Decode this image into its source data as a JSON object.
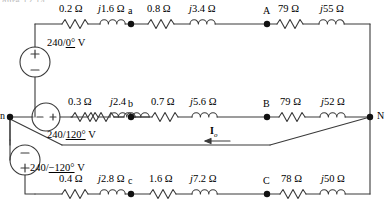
{
  "figure": {
    "cut_off_caption": "gure 12.14",
    "type": "three-phase-circuit-diagram"
  },
  "sources": [
    {
      "id": "phase-a",
      "label_value": "240",
      "label_angle": "0°",
      "label_unit": "V",
      "orientation": "vertical",
      "top_sign": "+",
      "bottom_sign": "−"
    },
    {
      "id": "phase-b",
      "label_value": "240",
      "label_angle": "120°",
      "label_unit": "V",
      "orientation": "horizontal",
      "left_sign": "−",
      "right_sign": "+"
    },
    {
      "id": "phase-c",
      "label_value": "240",
      "label_angle": "−120°",
      "label_unit": "V",
      "orientation": "vertical",
      "top_sign": "−",
      "bottom_sign": "+"
    }
  ],
  "nodes": [
    {
      "name": "n",
      "x": 10,
      "y": 117
    },
    {
      "name": "a",
      "x": 131,
      "y": 24
    },
    {
      "name": "A",
      "x": 267,
      "y": 24
    },
    {
      "name": "b",
      "x": 131,
      "y": 117
    },
    {
      "name": "B",
      "x": 267,
      "y": 117
    },
    {
      "name": "c",
      "x": 131,
      "y": 194
    },
    {
      "name": "C",
      "x": 267,
      "y": 194
    },
    {
      "name": "N",
      "x": 370,
      "y": 117
    }
  ],
  "lines": {
    "top": {
      "elements": [
        {
          "kind": "resistor",
          "label": "0.2 Ω"
        },
        {
          "kind": "inductor",
          "label": "j1.6 Ω",
          "j": true
        },
        {
          "kind": "node",
          "label": "a"
        },
        {
          "kind": "resistor",
          "label": "0.8 Ω"
        },
        {
          "kind": "inductor",
          "label": "j3.4 Ω",
          "j": true
        },
        {
          "kind": "node",
          "label": "A"
        },
        {
          "kind": "resistor",
          "label": "79 Ω"
        },
        {
          "kind": "inductor",
          "label": "j55 Ω",
          "j": true
        }
      ]
    },
    "middle": {
      "elements": [
        {
          "kind": "resistor",
          "label": "0.3 Ω"
        },
        {
          "kind": "inductor",
          "label": "j2.4",
          "j": true
        },
        {
          "kind": "node",
          "label": "b"
        },
        {
          "kind": "resistor",
          "label": "0.7 Ω"
        },
        {
          "kind": "inductor",
          "label": "j5.6 Ω",
          "j": true
        },
        {
          "kind": "node",
          "label": "B"
        },
        {
          "kind": "resistor",
          "label": "79 Ω"
        },
        {
          "kind": "inductor",
          "label": "j52 Ω",
          "j": true
        }
      ]
    },
    "bottom": {
      "elements": [
        {
          "kind": "resistor",
          "label": "0.4 Ω"
        },
        {
          "kind": "inductor",
          "label": "j2.8 Ω",
          "j": true
        },
        {
          "kind": "node",
          "label": "c"
        },
        {
          "kind": "resistor",
          "label": "1.6 Ω"
        },
        {
          "kind": "inductor",
          "label": "j7.2 Ω",
          "j": true
        },
        {
          "kind": "node",
          "label": "C"
        },
        {
          "kind": "resistor",
          "label": "78 Ω"
        },
        {
          "kind": "inductor",
          "label": "j50 Ω",
          "j": true
        }
      ]
    }
  },
  "current": {
    "symbol": "I",
    "subscript": "o",
    "direction": "left"
  },
  "colors": {
    "wire": "#3a3a3a",
    "text": "#000000",
    "background": "#ffffff"
  }
}
